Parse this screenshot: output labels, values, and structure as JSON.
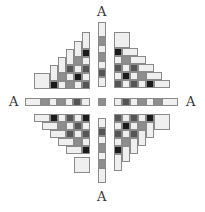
{
  "figure": {
    "labels": [
      {
        "text": "A",
        "x": 97,
        "y": 5,
        "name": "axis-label-top"
      },
      {
        "text": "A",
        "x": 9,
        "y": 95,
        "name": "axis-label-left"
      },
      {
        "text": "A",
        "x": 186,
        "y": 95,
        "name": "axis-label-right"
      },
      {
        "text": "A",
        "x": 97,
        "y": 190,
        "name": "axis-label-bottom"
      }
    ],
    "colors": {
      "L": "#efefef",
      "G": "#8e8e8e",
      "D": "#555555",
      "B": "#1a1a1a"
    },
    "unit": 8,
    "cells": [
      {
        "x": 98,
        "y": 22,
        "w": 8,
        "h": 15,
        "c": "L"
      },
      {
        "x": 98,
        "y": 37,
        "w": 8,
        "h": 8,
        "c": "G"
      },
      {
        "x": 98,
        "y": 45,
        "w": 8,
        "h": 8,
        "c": "L"
      },
      {
        "x": 98,
        "y": 53,
        "w": 8,
        "h": 8,
        "c": "G"
      },
      {
        "x": 98,
        "y": 61,
        "w": 8,
        "h": 8,
        "c": "L"
      },
      {
        "x": 98,
        "y": 69,
        "w": 8,
        "h": 8,
        "c": "D"
      },
      {
        "x": 98,
        "y": 77,
        "w": 8,
        "h": 10,
        "c": "L"
      },
      {
        "x": 98,
        "y": 98,
        "w": 8,
        "h": 8,
        "c": "G"
      },
      {
        "x": 98,
        "y": 118,
        "w": 8,
        "h": 10,
        "c": "L"
      },
      {
        "x": 98,
        "y": 128,
        "w": 8,
        "h": 8,
        "c": "D"
      },
      {
        "x": 98,
        "y": 136,
        "w": 8,
        "h": 8,
        "c": "L"
      },
      {
        "x": 98,
        "y": 144,
        "w": 8,
        "h": 8,
        "c": "G"
      },
      {
        "x": 98,
        "y": 152,
        "w": 8,
        "h": 8,
        "c": "L"
      },
      {
        "x": 98,
        "y": 160,
        "w": 8,
        "h": 8,
        "c": "G"
      },
      {
        "x": 98,
        "y": 168,
        "w": 8,
        "h": 15,
        "c": "L"
      },
      {
        "x": 25,
        "y": 98,
        "w": 16,
        "h": 8,
        "c": "L"
      },
      {
        "x": 41,
        "y": 98,
        "w": 8,
        "h": 8,
        "c": "G"
      },
      {
        "x": 49,
        "y": 98,
        "w": 8,
        "h": 8,
        "c": "L"
      },
      {
        "x": 57,
        "y": 98,
        "w": 8,
        "h": 8,
        "c": "G"
      },
      {
        "x": 65,
        "y": 98,
        "w": 8,
        "h": 8,
        "c": "L"
      },
      {
        "x": 73,
        "y": 98,
        "w": 8,
        "h": 8,
        "c": "D"
      },
      {
        "x": 81,
        "y": 98,
        "w": 9,
        "h": 8,
        "c": "L"
      },
      {
        "x": 114,
        "y": 98,
        "w": 8,
        "h": 8,
        "c": "L"
      },
      {
        "x": 122,
        "y": 98,
        "w": 8,
        "h": 8,
        "c": "D"
      },
      {
        "x": 130,
        "y": 98,
        "w": 8,
        "h": 8,
        "c": "L"
      },
      {
        "x": 138,
        "y": 98,
        "w": 8,
        "h": 8,
        "c": "G"
      },
      {
        "x": 146,
        "y": 98,
        "w": 8,
        "h": 8,
        "c": "L"
      },
      {
        "x": 154,
        "y": 98,
        "w": 8,
        "h": 8,
        "c": "G"
      },
      {
        "x": 162,
        "y": 98,
        "w": 16,
        "h": 8,
        "c": "L"
      },
      {
        "x": 34,
        "y": 73,
        "w": 16,
        "h": 16,
        "c": "L"
      },
      {
        "x": 50,
        "y": 81,
        "w": 8,
        "h": 8,
        "c": "B"
      },
      {
        "x": 58,
        "y": 81,
        "w": 8,
        "h": 8,
        "c": "L"
      },
      {
        "x": 66,
        "y": 81,
        "w": 8,
        "h": 8,
        "c": "G"
      },
      {
        "x": 74,
        "y": 81,
        "w": 8,
        "h": 8,
        "c": "L"
      },
      {
        "x": 82,
        "y": 81,
        "w": 8,
        "h": 8,
        "c": "D"
      },
      {
        "x": 50,
        "y": 65,
        "w": 8,
        "h": 16,
        "c": "L"
      },
      {
        "x": 58,
        "y": 73,
        "w": 8,
        "h": 8,
        "c": "G"
      },
      {
        "x": 66,
        "y": 73,
        "w": 8,
        "h": 8,
        "c": "L"
      },
      {
        "x": 74,
        "y": 73,
        "w": 8,
        "h": 8,
        "c": "B"
      },
      {
        "x": 82,
        "y": 73,
        "w": 8,
        "h": 8,
        "c": "L"
      },
      {
        "x": 58,
        "y": 57,
        "w": 8,
        "h": 16,
        "c": "L"
      },
      {
        "x": 66,
        "y": 65,
        "w": 8,
        "h": 8,
        "c": "D"
      },
      {
        "x": 74,
        "y": 65,
        "w": 8,
        "h": 8,
        "c": "L"
      },
      {
        "x": 82,
        "y": 65,
        "w": 8,
        "h": 8,
        "c": "D"
      },
      {
        "x": 66,
        "y": 49,
        "w": 8,
        "h": 16,
        "c": "L"
      },
      {
        "x": 74,
        "y": 57,
        "w": 8,
        "h": 8,
        "c": "G"
      },
      {
        "x": 82,
        "y": 57,
        "w": 8,
        "h": 8,
        "c": "L"
      },
      {
        "x": 74,
        "y": 41,
        "w": 8,
        "h": 16,
        "c": "L"
      },
      {
        "x": 82,
        "y": 49,
        "w": 8,
        "h": 8,
        "c": "B"
      },
      {
        "x": 82,
        "y": 32,
        "w": 8,
        "h": 17,
        "c": "L"
      },
      {
        "x": 114,
        "y": 32,
        "w": 16,
        "h": 16,
        "c": "L"
      },
      {
        "x": 114,
        "y": 48,
        "w": 8,
        "h": 8,
        "c": "B"
      },
      {
        "x": 122,
        "y": 48,
        "w": 16,
        "h": 8,
        "c": "L"
      },
      {
        "x": 114,
        "y": 56,
        "w": 8,
        "h": 8,
        "c": "L"
      },
      {
        "x": 122,
        "y": 56,
        "w": 8,
        "h": 8,
        "c": "G"
      },
      {
        "x": 130,
        "y": 56,
        "w": 16,
        "h": 8,
        "c": "L"
      },
      {
        "x": 114,
        "y": 64,
        "w": 8,
        "h": 8,
        "c": "D"
      },
      {
        "x": 122,
        "y": 64,
        "w": 8,
        "h": 8,
        "c": "L"
      },
      {
        "x": 130,
        "y": 64,
        "w": 8,
        "h": 8,
        "c": "D"
      },
      {
        "x": 138,
        "y": 64,
        "w": 16,
        "h": 8,
        "c": "L"
      },
      {
        "x": 114,
        "y": 72,
        "w": 8,
        "h": 8,
        "c": "L"
      },
      {
        "x": 122,
        "y": 72,
        "w": 8,
        "h": 8,
        "c": "B"
      },
      {
        "x": 130,
        "y": 72,
        "w": 8,
        "h": 8,
        "c": "L"
      },
      {
        "x": 138,
        "y": 72,
        "w": 8,
        "h": 8,
        "c": "G"
      },
      {
        "x": 146,
        "y": 72,
        "w": 16,
        "h": 8,
        "c": "L"
      },
      {
        "x": 114,
        "y": 80,
        "w": 8,
        "h": 8,
        "c": "D"
      },
      {
        "x": 122,
        "y": 80,
        "w": 8,
        "h": 8,
        "c": "L"
      },
      {
        "x": 130,
        "y": 80,
        "w": 8,
        "h": 8,
        "c": "D"
      },
      {
        "x": 138,
        "y": 80,
        "w": 8,
        "h": 8,
        "c": "L"
      },
      {
        "x": 146,
        "y": 80,
        "w": 8,
        "h": 8,
        "c": "B"
      },
      {
        "x": 154,
        "y": 80,
        "w": 16,
        "h": 8,
        "c": "L"
      },
      {
        "x": 34,
        "y": 114,
        "w": 16,
        "h": 8,
        "c": "L"
      },
      {
        "x": 50,
        "y": 114,
        "w": 8,
        "h": 8,
        "c": "B"
      },
      {
        "x": 58,
        "y": 114,
        "w": 8,
        "h": 8,
        "c": "L"
      },
      {
        "x": 66,
        "y": 114,
        "w": 8,
        "h": 8,
        "c": "D"
      },
      {
        "x": 74,
        "y": 114,
        "w": 8,
        "h": 8,
        "c": "L"
      },
      {
        "x": 82,
        "y": 114,
        "w": 8,
        "h": 8,
        "c": "B"
      },
      {
        "x": 42,
        "y": 122,
        "w": 16,
        "h": 8,
        "c": "L"
      },
      {
        "x": 58,
        "y": 122,
        "w": 8,
        "h": 8,
        "c": "G"
      },
      {
        "x": 66,
        "y": 122,
        "w": 8,
        "h": 8,
        "c": "L"
      },
      {
        "x": 74,
        "y": 122,
        "w": 8,
        "h": 8,
        "c": "D"
      },
      {
        "x": 82,
        "y": 122,
        "w": 8,
        "h": 8,
        "c": "L"
      },
      {
        "x": 50,
        "y": 130,
        "w": 16,
        "h": 8,
        "c": "L"
      },
      {
        "x": 66,
        "y": 130,
        "w": 8,
        "h": 8,
        "c": "D"
      },
      {
        "x": 74,
        "y": 130,
        "w": 8,
        "h": 8,
        "c": "L"
      },
      {
        "x": 82,
        "y": 130,
        "w": 8,
        "h": 8,
        "c": "D"
      },
      {
        "x": 58,
        "y": 138,
        "w": 16,
        "h": 8,
        "c": "L"
      },
      {
        "x": 74,
        "y": 138,
        "w": 8,
        "h": 8,
        "c": "G"
      },
      {
        "x": 82,
        "y": 138,
        "w": 8,
        "h": 8,
        "c": "L"
      },
      {
        "x": 66,
        "y": 146,
        "w": 16,
        "h": 8,
        "c": "L"
      },
      {
        "x": 82,
        "y": 146,
        "w": 8,
        "h": 8,
        "c": "B"
      },
      {
        "x": 74,
        "y": 157,
        "w": 16,
        "h": 16,
        "c": "L"
      },
      {
        "x": 114,
        "y": 114,
        "w": 8,
        "h": 8,
        "c": "D"
      },
      {
        "x": 122,
        "y": 114,
        "w": 8,
        "h": 8,
        "c": "L"
      },
      {
        "x": 130,
        "y": 114,
        "w": 8,
        "h": 8,
        "c": "D"
      },
      {
        "x": 138,
        "y": 114,
        "w": 8,
        "h": 8,
        "c": "L"
      },
      {
        "x": 146,
        "y": 114,
        "w": 8,
        "h": 8,
        "c": "B"
      },
      {
        "x": 154,
        "y": 114,
        "w": 16,
        "h": 16,
        "c": "L"
      },
      {
        "x": 114,
        "y": 122,
        "w": 8,
        "h": 8,
        "c": "L"
      },
      {
        "x": 122,
        "y": 122,
        "w": 8,
        "h": 8,
        "c": "B"
      },
      {
        "x": 130,
        "y": 122,
        "w": 8,
        "h": 8,
        "c": "L"
      },
      {
        "x": 138,
        "y": 122,
        "w": 8,
        "h": 8,
        "c": "G"
      },
      {
        "x": 146,
        "y": 122,
        "w": 8,
        "h": 16,
        "c": "L"
      },
      {
        "x": 114,
        "y": 130,
        "w": 8,
        "h": 8,
        "c": "D"
      },
      {
        "x": 122,
        "y": 130,
        "w": 8,
        "h": 8,
        "c": "L"
      },
      {
        "x": 130,
        "y": 130,
        "w": 8,
        "h": 8,
        "c": "D"
      },
      {
        "x": 138,
        "y": 130,
        "w": 8,
        "h": 16,
        "c": "L"
      },
      {
        "x": 114,
        "y": 138,
        "w": 8,
        "h": 8,
        "c": "L"
      },
      {
        "x": 122,
        "y": 138,
        "w": 8,
        "h": 8,
        "c": "G"
      },
      {
        "x": 130,
        "y": 138,
        "w": 8,
        "h": 16,
        "c": "L"
      },
      {
        "x": 114,
        "y": 146,
        "w": 8,
        "h": 8,
        "c": "B"
      },
      {
        "x": 122,
        "y": 146,
        "w": 8,
        "h": 16,
        "c": "L"
      },
      {
        "x": 114,
        "y": 154,
        "w": 8,
        "h": 17,
        "c": "L"
      }
    ]
  }
}
